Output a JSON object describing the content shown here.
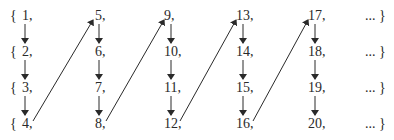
{
  "diagram": {
    "type": "enumeration-of-union-of-sets",
    "rows": [
      {
        "open": "{",
        "items": [
          "1,",
          "5,",
          "9,",
          "13,",
          "17,"
        ],
        "tail": "... }"
      },
      {
        "open": "{",
        "items": [
          "2,",
          "6,",
          "10,",
          "14,",
          "18,"
        ],
        "tail": "... }"
      },
      {
        "open": "{",
        "items": [
          "3,",
          "7,",
          "11,",
          "15,",
          "19,"
        ],
        "tail": "... }"
      },
      {
        "open": "{",
        "items": [
          "4,",
          "8,",
          "12,",
          "16,",
          "20,"
        ],
        "tail": "... }"
      }
    ],
    "arrows": {
      "vertical": "down arrows within each column from row 1 to row 4",
      "diagonal": [
        "4 -> 5",
        "8 -> 9",
        "12 -> 13",
        "16 -> 17"
      ]
    },
    "colors": {
      "ink": "#2a2a2a",
      "background": "#ffffff"
    }
  }
}
